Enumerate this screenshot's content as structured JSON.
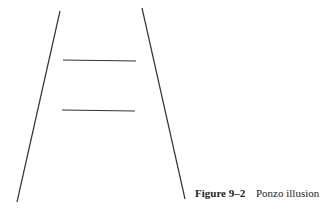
{
  "figure": {
    "label": "Figure 9–2",
    "title": "Ponzo illusion",
    "line_color": "#333333",
    "converging_lines": [
      {
        "name": "left",
        "x1": 60,
        "y1": 11,
        "x2": 17,
        "y2": 202
      },
      {
        "name": "right",
        "x1": 142,
        "y1": 8,
        "x2": 185,
        "y2": 199
      }
    ],
    "horizontal_lines": [
      {
        "name": "upper",
        "x1": 63,
        "y1": 60,
        "x2": 136,
        "y2": 61
      },
      {
        "name": "lower",
        "x1": 62,
        "y1": 110,
        "x2": 135,
        "y2": 111
      }
    ]
  }
}
